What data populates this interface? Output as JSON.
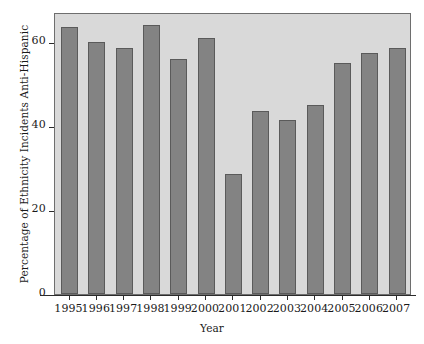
{
  "chart_data": {
    "type": "bar",
    "title": "",
    "xlabel": "Year",
    "ylabel": "Percentage of Ethnicity Incidents Anti-Hispanic",
    "categories": [
      "1995",
      "1996",
      "1997",
      "1998",
      "1999",
      "2000",
      "2001",
      "2002",
      "2003",
      "2004",
      "2005",
      "2006",
      "2007"
    ],
    "values": [
      63.5,
      60.0,
      58.5,
      64.0,
      56.0,
      61.0,
      28.5,
      43.5,
      41.5,
      45.0,
      55.0,
      57.5,
      58.5
    ],
    "ylim": [
      0,
      67
    ],
    "yticks": [
      0,
      20,
      40,
      60
    ],
    "ytick_labels": [
      "0",
      "20",
      "40",
      "60"
    ],
    "grid": false,
    "legend": null,
    "colors": {
      "bar_fill": "#838383",
      "bar_border": "#5a5a5a",
      "panel_background": "#d9d9d9",
      "panel_border": "#6e6e6e",
      "axis": "#2b2b2b",
      "text": "#1a1a1a",
      "figure_background": "#ffffff"
    }
  }
}
